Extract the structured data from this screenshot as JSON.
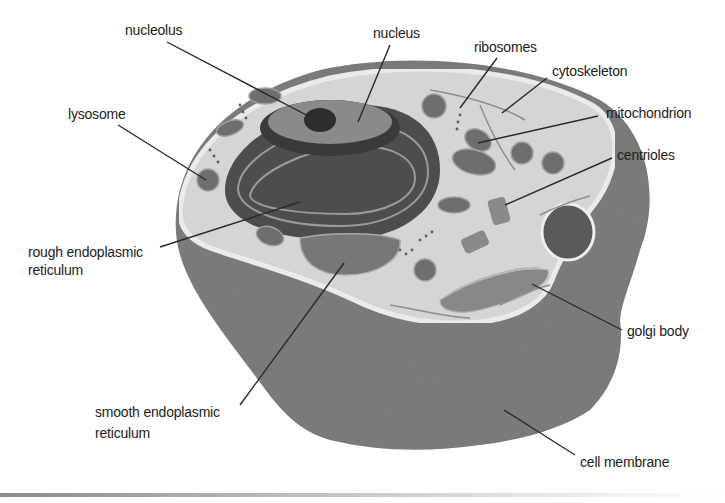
{
  "diagram": {
    "colors": {
      "background": "#ffffff",
      "outer_body": "#7d7d7d",
      "cytoplasm": "#d9d9d9",
      "membrane_rim": "#ececec",
      "nucleus_dark": "#3e3e3e",
      "organelle": "#6e6e6e",
      "leader_line": "#2a2a2a",
      "label_text": "#1c1c1c"
    },
    "labels": {
      "nucleolus": "nucleolus",
      "nucleus": "nucleus",
      "ribosomes": "ribosomes",
      "cytoskeleton": "cytoskeleton",
      "mitochondrion": "mitochondrion",
      "centrioles": "centrioles",
      "lysosome": "lysosome",
      "rough_er_line1": "rough endoplasmic",
      "rough_er_line2": "reticulum",
      "smooth_er_line1": "smooth endoplasmic",
      "smooth_er_line2": "reticulum",
      "golgi_body": "golgi body",
      "cell_membrane": "cell membrane"
    }
  }
}
